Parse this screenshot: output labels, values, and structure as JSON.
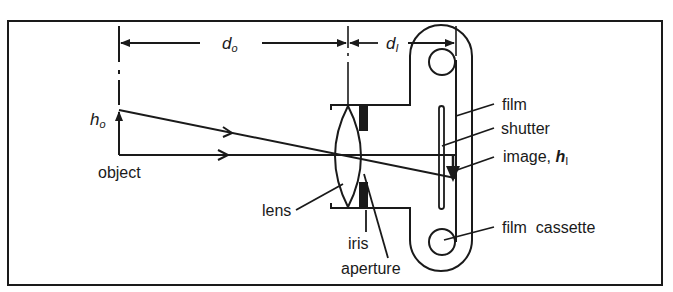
{
  "diagram": {
    "type": "camera-optics-schematic",
    "labels": {
      "d_o_main": "d",
      "d_o_sub": "o",
      "d_i_main": "d",
      "d_i_sub": "I",
      "h_o_main": "h",
      "h_o_sub": "o",
      "object": "object",
      "lens": "lens",
      "iris": "iris",
      "aperture": "aperture",
      "film": "film",
      "shutter": "shutter",
      "image_prefix": "image, ",
      "image_h": "h",
      "image_sub": "I",
      "film_cassette": "film  cassette"
    },
    "colors": {
      "line": "#1a1a1a",
      "background": "#ffffff"
    }
  }
}
